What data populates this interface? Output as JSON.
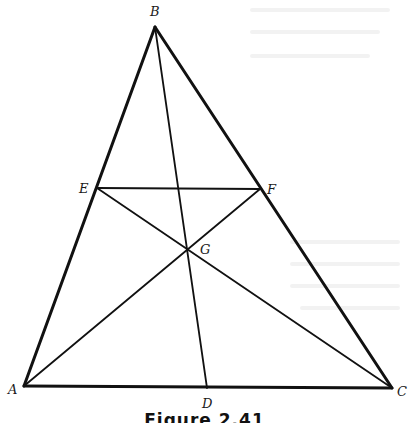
{
  "figure": {
    "caption": "Figure 2.41",
    "stroke_color": "#111111",
    "points": {
      "A": {
        "label": "A",
        "x": 24,
        "y": 386,
        "lx": 8,
        "ly": 394
      },
      "B": {
        "label": "B",
        "x": 155,
        "y": 27,
        "lx": 150,
        "ly": 16
      },
      "C": {
        "label": "C",
        "x": 392,
        "y": 388,
        "lx": 397,
        "ly": 396
      },
      "D": {
        "label": "D",
        "x": 207,
        "y": 388,
        "lx": 202,
        "ly": 408
      },
      "E": {
        "label": "E",
        "x": 97,
        "y": 188,
        "lx": 79,
        "ly": 193
      },
      "F": {
        "label": "F",
        "x": 260,
        "y": 189,
        "lx": 267,
        "ly": 194
      },
      "G": {
        "label": "G",
        "x": 188,
        "y": 250,
        "lx": 200,
        "ly": 254
      }
    },
    "segments": [
      {
        "from": "A",
        "to": "B",
        "kind": "side"
      },
      {
        "from": "B",
        "to": "C",
        "kind": "side"
      },
      {
        "from": "A",
        "to": "C",
        "kind": "side"
      },
      {
        "from": "B",
        "to": "D",
        "kind": "cevian"
      },
      {
        "from": "A",
        "to": "F",
        "kind": "cevian"
      },
      {
        "from": "C",
        "to": "E",
        "kind": "cevian"
      },
      {
        "from": "E",
        "to": "F",
        "kind": "segment"
      }
    ]
  }
}
